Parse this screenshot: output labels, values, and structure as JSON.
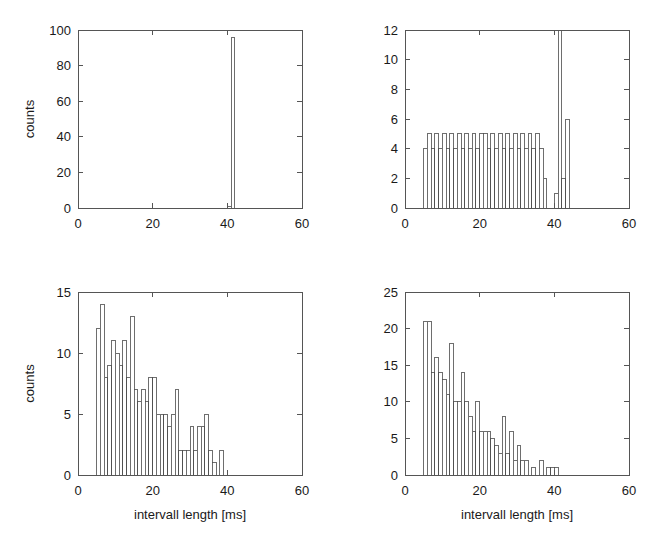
{
  "figure": {
    "background": "#ffffff",
    "axis_color": "#555555",
    "bar_edge_color": "#4a4a4a",
    "bar_fill_color": "#ffffff",
    "text_color": "#1a1a1a",
    "layout": "2x2 grid of histogram panels"
  },
  "chart_data": [
    {
      "id": "top-left",
      "type": "bar",
      "title": "",
      "subtitle": "",
      "xlabel": "",
      "ylabel": "counts",
      "xlim": [
        0,
        60
      ],
      "ylim": [
        0,
        100
      ],
      "xticks": [
        0,
        20,
        40,
        60
      ],
      "xticklabels": [
        "0",
        "20",
        "40",
        "60"
      ],
      "yticks": [
        0,
        20,
        40,
        60,
        80,
        100
      ],
      "yticklabels": [
        "0",
        "20",
        "40",
        "60",
        "80",
        "100"
      ],
      "grid": false,
      "legend": "none",
      "bin_width": 1,
      "bin_starts": [
        40,
        41
      ],
      "values": [
        1,
        96
      ],
      "annotations": []
    },
    {
      "id": "top-right",
      "type": "bar",
      "title": "",
      "subtitle": "",
      "xlabel": "",
      "ylabel": "",
      "xlim": [
        0,
        60
      ],
      "ylim": [
        0,
        12
      ],
      "xticks": [
        0,
        20,
        40,
        60
      ],
      "xticklabels": [
        "0",
        "20",
        "40",
        "60"
      ],
      "yticks": [
        0,
        2,
        4,
        6,
        8,
        10,
        12
      ],
      "yticklabels": [
        "0",
        "2",
        "4",
        "6",
        "8",
        "10",
        "12"
      ],
      "grid": false,
      "legend": "none",
      "bin_width": 1,
      "bin_starts": [
        5,
        6,
        7,
        8,
        9,
        10,
        11,
        12,
        13,
        14,
        15,
        16,
        17,
        18,
        19,
        20,
        21,
        22,
        23,
        24,
        25,
        26,
        27,
        28,
        29,
        30,
        31,
        32,
        33,
        34,
        35,
        36,
        37,
        40,
        41,
        42,
        43
      ],
      "values": [
        4,
        5,
        4,
        5,
        4,
        5,
        4,
        5,
        4,
        5,
        4,
        5,
        4,
        5,
        4,
        5,
        5,
        4,
        5,
        4,
        5,
        4,
        5,
        4,
        5,
        4,
        5,
        4,
        5,
        4,
        5,
        4,
        2,
        1,
        30,
        2,
        6
      ],
      "clipped_bars": [
        {
          "bin_start": 41,
          "true_value": 30,
          "note": "bar extends beyond top of axis"
        }
      ],
      "annotations": []
    },
    {
      "id": "bottom-left",
      "type": "bar",
      "title": "",
      "subtitle": "",
      "xlabel": "intervall length [ms]",
      "ylabel": "counts",
      "xlim": [
        0,
        60
      ],
      "ylim": [
        0,
        15
      ],
      "xticks": [
        0,
        20,
        40,
        60
      ],
      "xticklabels": [
        "0",
        "20",
        "40",
        "60"
      ],
      "yticks": [
        0,
        5,
        10,
        15
      ],
      "yticklabels": [
        "0",
        "5",
        "10",
        "15"
      ],
      "grid": false,
      "legend": "none",
      "bin_width": 1,
      "bin_starts": [
        5,
        6,
        7,
        8,
        9,
        10,
        11,
        12,
        13,
        14,
        15,
        16,
        17,
        18,
        19,
        20,
        21,
        22,
        23,
        24,
        25,
        26,
        27,
        28,
        29,
        30,
        31,
        32,
        33,
        34,
        35,
        36,
        37,
        38,
        39,
        41
      ],
      "values": [
        12,
        14,
        8,
        9,
        11,
        10,
        9,
        11,
        8,
        13,
        7,
        6,
        7,
        6,
        8,
        8,
        5,
        5,
        5,
        4,
        5,
        7,
        2,
        2,
        2,
        4,
        2,
        4,
        4,
        5,
        2,
        1,
        0,
        2,
        0,
        0
      ],
      "annotations": []
    },
    {
      "id": "bottom-right",
      "type": "bar",
      "title": "",
      "subtitle": "",
      "xlabel": "intervall length [ms]",
      "ylabel": "",
      "xlim": [
        0,
        60
      ],
      "ylim": [
        0,
        25
      ],
      "xticks": [
        0,
        20,
        40,
        60
      ],
      "xticklabels": [
        "0",
        "20",
        "40",
        "60"
      ],
      "yticks": [
        0,
        5,
        10,
        15,
        20,
        25
      ],
      "yticklabels": [
        "0",
        "5",
        "10",
        "15",
        "20",
        "25"
      ],
      "grid": false,
      "legend": "none",
      "bin_width": 1,
      "bin_starts": [
        5,
        6,
        7,
        8,
        9,
        10,
        11,
        12,
        13,
        14,
        15,
        16,
        17,
        18,
        19,
        20,
        21,
        22,
        23,
        24,
        25,
        26,
        27,
        28,
        29,
        30,
        31,
        32,
        33,
        34,
        35,
        36,
        37,
        38,
        39,
        40
      ],
      "values": [
        21,
        21,
        14,
        16,
        14,
        13,
        11,
        18,
        10,
        10,
        14,
        10,
        8,
        6,
        10,
        6,
        6,
        6,
        5,
        4,
        3,
        8,
        3,
        6,
        2,
        4,
        2,
        2,
        0,
        1,
        0,
        2,
        0,
        1,
        1,
        1
      ],
      "annotations": []
    }
  ]
}
